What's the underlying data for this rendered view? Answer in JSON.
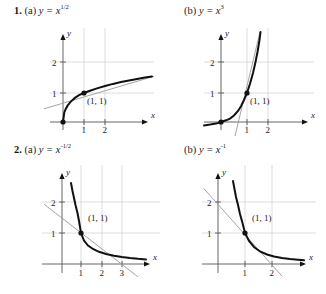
{
  "document": {
    "type": "textbook-exercise-figure",
    "problems": [
      {
        "number": "1.",
        "parts": [
          {
            "part": "(a)",
            "equation_prefix": "y = x",
            "exponent": "1/2",
            "equation_full": "y = x^(1/2)",
            "graph": {
              "point_label": "(1, 1)",
              "x_axis_label": "x",
              "y_axis_label": "y",
              "x_ticks": [
                "1",
                "2"
              ],
              "y_ticks": [
                "1",
                "2"
              ],
              "origin_dot": true,
              "tangent_at": "(1, 1)",
              "tangent_slope": 0.5
            }
          },
          {
            "part": "(b)",
            "equation_prefix": "y = x",
            "exponent": "3",
            "equation_full": "y = x^3",
            "graph": {
              "point_label": "(1, 1)",
              "x_axis_label": "x",
              "y_axis_label": "y",
              "x_ticks": [
                "1",
                "2"
              ],
              "y_ticks": [
                "1",
                "2"
              ],
              "origin_dot": true,
              "tangent_at": "(1, 1)",
              "tangent_slope": 3
            }
          }
        ]
      },
      {
        "number": "2.",
        "parts": [
          {
            "part": "(a)",
            "equation_prefix": "y = x",
            "exponent": "-1/2",
            "equation_full": "y = x^(-1/2)",
            "graph": {
              "point_label": "(1, 1)",
              "x_axis_label": "x",
              "y_axis_label": "y",
              "x_ticks": [
                "1",
                "2",
                "3"
              ],
              "y_ticks": [
                "1",
                "2"
              ],
              "origin_dot": false,
              "tangent_at": "(1, 1)",
              "tangent_slope": -0.5
            }
          },
          {
            "part": "(b)",
            "equation_prefix": "y = x",
            "exponent": "-1",
            "equation_full": "y = x^(-1)",
            "graph": {
              "point_label": "(1, 1)",
              "x_axis_label": "x",
              "y_axis_label": "y",
              "x_ticks": [
                "1",
                "2"
              ],
              "y_ticks": [
                "1",
                "2"
              ],
              "origin_dot": false,
              "tangent_at": "(1, 1)",
              "tangent_slope": -1
            }
          }
        ]
      }
    ],
    "colors": {
      "curve": "#111111",
      "tangent": "#9a9a9a",
      "grid": "#cfcfcf",
      "axis": "#555555",
      "text": "#1a1a1a",
      "background": "#ffffff"
    }
  }
}
